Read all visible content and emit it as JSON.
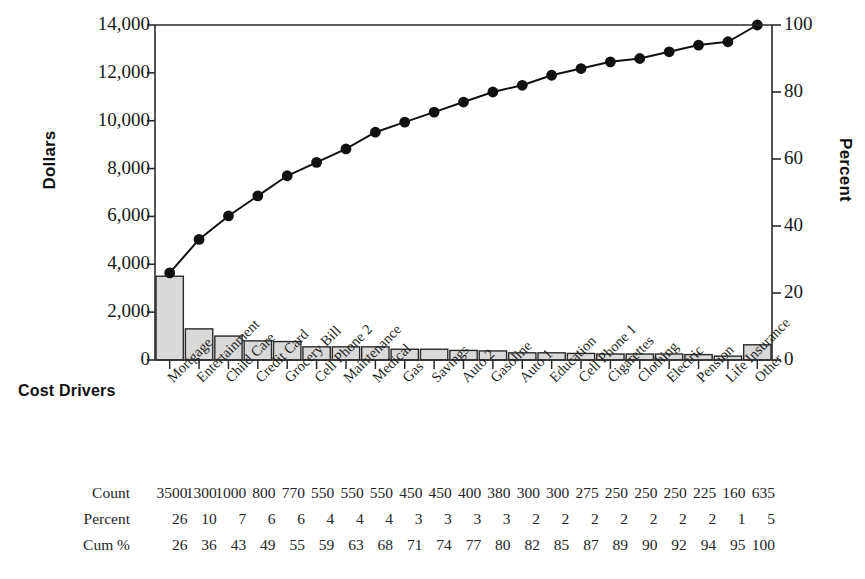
{
  "title": {
    "text": ""
  },
  "axes": {
    "y_left_title": "Dollars",
    "y_right_title": "Percent",
    "x_title": "Cost Drivers",
    "y_left_ticks": [
      "0",
      "2,000",
      "4,000",
      "6,000",
      "8,000",
      "10,000",
      "12,000",
      "14,000"
    ],
    "y_right_ticks": [
      "0",
      "20",
      "40",
      "60",
      "80",
      "100"
    ],
    "y_left_min": 0,
    "y_left_max": 14000,
    "y_right_min": 0,
    "y_right_max": 100
  },
  "table": {
    "row_labels": [
      "Count",
      "Percent",
      "Cum %"
    ],
    "counts": [
      "3500",
      "1300",
      "1000",
      "800",
      "770",
      "550",
      "550",
      "550",
      "450",
      "450",
      "400",
      "380",
      "300",
      "300",
      "275",
      "250",
      "250",
      "250",
      "225",
      "160",
      "635"
    ],
    "percents": [
      "26",
      "10",
      "7",
      "6",
      "6",
      "4",
      "4",
      "4",
      "3",
      "3",
      "3",
      "3",
      "2",
      "2",
      "2",
      "2",
      "2",
      "2",
      "2",
      "1",
      "5"
    ],
    "cumpct": [
      "26",
      "36",
      "43",
      "49",
      "55",
      "59",
      "63",
      "68",
      "71",
      "74",
      "77",
      "80",
      "82",
      "85",
      "87",
      "89",
      "90",
      "92",
      "94",
      "95",
      "100"
    ]
  },
  "colors": {
    "bar_fill": "#d9d9d9",
    "bar_stroke": "#2a2a2a",
    "line": "#111111",
    "marker": "#111111",
    "frame": "#2a2a2a",
    "text": "#16181a"
  },
  "chart_data": {
    "type": "bar",
    "title": "",
    "xlabel": "Cost Drivers",
    "ylabel": "Dollars",
    "y2label": "Percent",
    "ylim": [
      0,
      14000
    ],
    "y2lim": [
      0,
      100
    ],
    "grid": false,
    "legend": "none",
    "categories": [
      "Mortgage",
      "Entertainment",
      "Child Care",
      "Credit Card",
      "Grocery Bill",
      "Cell Phone 2",
      "Maintenance",
      "Medical",
      "Gas",
      "Savings",
      "Auto 2",
      "Gasoline",
      "Auto 1",
      "Education",
      "Cell Phone 1",
      "Cigarettes",
      "Clothing",
      "Electric",
      "Pension",
      "Life Insurance",
      "Other"
    ],
    "series": [
      {
        "name": "Count",
        "type": "bar",
        "axis": "left",
        "values": [
          3500,
          1300,
          1000,
          800,
          770,
          550,
          550,
          550,
          450,
          450,
          400,
          380,
          300,
          300,
          275,
          250,
          250,
          250,
          225,
          160,
          635
        ]
      },
      {
        "name": "Percent",
        "type": "label",
        "values": [
          26,
          10,
          7,
          6,
          6,
          4,
          4,
          4,
          3,
          3,
          3,
          3,
          2,
          2,
          2,
          2,
          2,
          2,
          2,
          1,
          5
        ]
      },
      {
        "name": "Cum %",
        "type": "line",
        "axis": "right",
        "values": [
          26,
          36,
          43,
          49,
          55,
          59,
          63,
          68,
          71,
          74,
          77,
          80,
          82,
          85,
          87,
          89,
          90,
          92,
          94,
          95,
          100
        ]
      }
    ]
  }
}
